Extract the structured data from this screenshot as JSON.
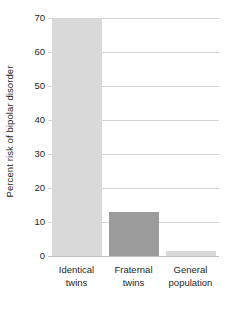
{
  "chart_data": {
    "type": "bar",
    "title": "",
    "xlabel": "",
    "ylabel": "Percent risk of bipolar disorder",
    "categories": [
      "Identical twins",
      "Fraternal twins",
      "General population"
    ],
    "category_lines": [
      [
        "Identical",
        "twins"
      ],
      [
        "Fraternal",
        "twins"
      ],
      [
        "General",
        "population"
      ]
    ],
    "values": [
      70,
      13,
      1.5
    ],
    "ylim": [
      0,
      70
    ],
    "yticks": [
      0,
      10,
      20,
      30,
      40,
      50,
      60,
      70
    ],
    "ytick_labels": [
      "0",
      "10",
      "20",
      "30",
      "40",
      "50",
      "60",
      "70"
    ],
    "grid": true,
    "legend": "none",
    "bar_colors": [
      "#d9d9d9",
      "#9b9b9b",
      "#d9d9d9"
    ]
  },
  "colors": {
    "background": "#ffffff",
    "text": "#231f20",
    "gridline": "#d5d5d5",
    "axis": "#bfbfbf",
    "bar_light": "#d9d9d9",
    "bar_dark": "#9b9b9b"
  }
}
